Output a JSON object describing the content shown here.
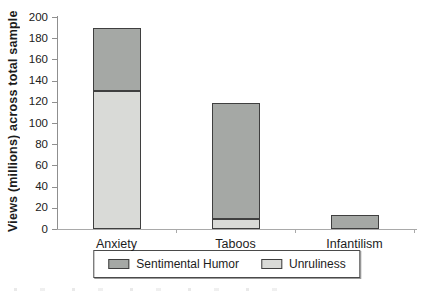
{
  "chart_data": {
    "type": "bar",
    "stacked": true,
    "title": "",
    "xlabel": "",
    "ylabel": "Views (millions) across total sample",
    "ylim": [
      0,
      200
    ],
    "ytick_step": 20,
    "yticks": [
      0,
      20,
      40,
      60,
      80,
      100,
      120,
      140,
      160,
      180,
      200
    ],
    "categories": [
      "Anxiety",
      "Taboos",
      "Infantilism"
    ],
    "series": [
      {
        "name": "Sentimental Humor",
        "color": "#a5a8a5",
        "values": [
          60,
          110,
          13
        ]
      },
      {
        "name": "Unruliness",
        "color": "#d9dad7",
        "values": [
          130,
          9,
          0
        ]
      }
    ],
    "grid": false,
    "legend_position": "bottom",
    "bar_border_color": "#3f3f3f",
    "background_color": "#ffffff"
  }
}
